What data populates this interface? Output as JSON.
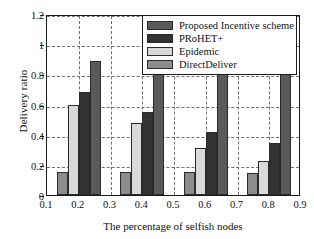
{
  "chart_data": {
    "type": "bar",
    "title": "",
    "xlabel": "The percentage of selfish nodes",
    "ylabel": "Delivery ratio",
    "categories": [
      "0.2",
      "0.4",
      "0.6",
      "0.8"
    ],
    "x_tick_labels": [
      "0.1",
      "0.2",
      "0.3",
      "0.4",
      "0.5",
      "0.6",
      "0.7",
      "0.8",
      "0.9"
    ],
    "y_tick_labels": [
      "0",
      "0.2",
      "0.4",
      "0.6",
      "0.8",
      "1",
      "1.2"
    ],
    "xlim": [
      0.1,
      0.9
    ],
    "ylim": [
      0,
      1.2
    ],
    "grid": true,
    "legend_position": "top-right",
    "series": [
      {
        "name": "Proposed Incentive scheme",
        "color": "#5a5a5a",
        "values": [
          0.89,
          0.845,
          0.835,
          0.815
        ]
      },
      {
        "name": "PRoHET+",
        "color": "#333333",
        "values": [
          0.68,
          0.55,
          0.415,
          0.345
        ]
      },
      {
        "name": "Epidemic",
        "color": "#d9d9d9",
        "values": [
          0.6,
          0.48,
          0.315,
          0.225
        ]
      },
      {
        "name": "DirectDeliver",
        "color": "#8c8c8c",
        "values": [
          0.155,
          0.155,
          0.15,
          0.145
        ]
      }
    ],
    "series_draw_order": [
      "DirectDeliver",
      "Epidemic",
      "PRoHET+",
      "Proposed Incentive scheme"
    ]
  },
  "legend": {
    "items": [
      {
        "label": "Proposed Incentive scheme",
        "color": "#5a5a5a"
      },
      {
        "label": "PRoHET+",
        "color": "#333333"
      },
      {
        "label": "Epidemic",
        "color": "#d9d9d9"
      },
      {
        "label": "DirectDeliver",
        "color": "#8c8c8c"
      }
    ]
  },
  "colors": {
    "axis": "#1a1a1a",
    "grid": "#6f6f6f",
    "background": "#ffffff",
    "text": "#111111"
  }
}
